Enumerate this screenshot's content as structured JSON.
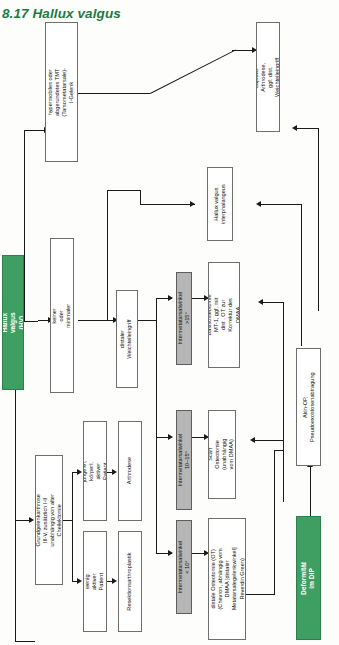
{
  "page": {
    "title": "8.17 Hallux valgus",
    "section_number": "8.17",
    "section_name": "Hallux valgus",
    "accent_color": "#1c7a43",
    "green_box_color": "#3f9e62",
    "grey_box_color": "#b6b6b6",
    "diagram_type": "clinical treatment algorithm flowchart",
    "orientation": "rotated 90 degrees (landscape flowchart on portrait page)"
  },
  "nodes": {
    "start": {
      "id": "hallux-valgus-hv",
      "label": "Hallux valgus (HV)",
      "style": "green"
    },
    "deformity_dip": {
      "id": "deformitaet-im-dip",
      "label": "Deformität im DIP",
      "style": "green"
    },
    "tmt_joint": {
      "id": "hypermobiles-tmt-gelenk",
      "label": "hypermobiles oder abgerundetes TMT (Tarsometatarsale)-I-Gelenk",
      "style": "white"
    },
    "lapidus": {
      "id": "lapidus-arthrodese",
      "label": "Lapidus-Arthrodese, ggf. dist. Weichteileingriff",
      "style": "white"
    },
    "hv_interphalangeus": {
      "id": "hallux-valgus-interphalangeus",
      "label": "Hallux valgus interphalangeus",
      "style": "white"
    },
    "hv_minimal_arthrose": {
      "id": "hv-mit-keiner-oder-minimaler-arthrose",
      "label": "HV mit keiner oder minimaler Arthrose",
      "style": "white"
    },
    "distal_soft_tissue": {
      "id": "distaler-weichteileingriff",
      "label": "distaler Weichteileingriff",
      "style": "white"
    },
    "ima_gt15": {
      "id": "intermetatarsalwinkel-gt-15",
      "label": "Intermetatarsalwinkel >15°",
      "style": "grey"
    },
    "ima_10_15": {
      "id": "intermetatarsalwinkel-10-15",
      "label": "Intermetatarsalwinkel 10–15°",
      "style": "grey"
    },
    "ima_lt10": {
      "id": "intermetatarsalwinkel-lt-10",
      "label": "Intermetatarsalwinkel < 10°",
      "style": "grey"
    },
    "basis_osteotomy": {
      "id": "basisosteotomie-mt-1",
      "label": "Basisosteotomie MT-1, ggf. mit dist . OT zur Korrektur des DMAA",
      "style": "white"
    },
    "scarf_osteotomy": {
      "id": "scarf-osteotomie",
      "label": "Scarf Osteotomie (unabhängig vom DMAA)",
      "style": "white"
    },
    "distal_osteotomy": {
      "id": "distale-osteotomie",
      "label": "distale Osteotomie (OT) (Chevron, abhängig vom DMAA [distaler Metatarsalegelenkwinkel] Reverdin Green)",
      "style": "white"
    },
    "akin_op": {
      "id": "akin-op-pseudoexostosenabtragung",
      "label": "Akin-OP, Pseudoexostosenabtragung",
      "style": "white"
    },
    "arthrosis_grade": {
      "id": "grundgelenkarthrose",
      "label": "Grundgelenkarthrose III-V, zusätzlich I-II unabhängig von alter Cheilektomie",
      "style": "white"
    },
    "young_active": {
      "id": "juengerer-koerperlich-aktiver-patient",
      "label": "jüngerer, körperl. aktiver Patient",
      "style": "white"
    },
    "less_active": {
      "id": "wenig-aktiver-patient",
      "label": "wenig aktiver Patient",
      "style": "white"
    },
    "arthrodesis": {
      "id": "arthrodese",
      "label": "Arthrodese",
      "style": "white"
    },
    "resection_arthroplasty": {
      "id": "resektionsarthroplastik",
      "label": "Resektionsarthroplastik",
      "style": "white"
    }
  }
}
